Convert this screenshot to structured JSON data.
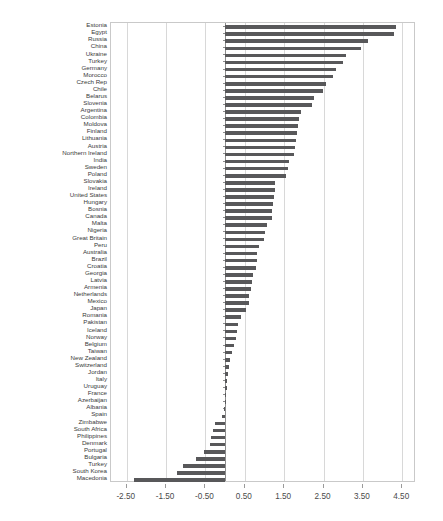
{
  "chart_data": {
    "type": "bar",
    "orientation": "horizontal",
    "title": "",
    "subtitle": "",
    "xlabel": "",
    "ylabel": "",
    "xlim": [
      -2.9,
      4.85
    ],
    "grid": true,
    "legend": null,
    "bar_color": "#58585a",
    "xticks": [
      -2.5,
      -1.5,
      -0.5,
      0.5,
      1.5,
      2.5,
      3.5,
      4.5
    ],
    "xticklabels": [
      "-2.50",
      "-1.50",
      "-0.50",
      "0.50",
      "1.50",
      "2.50",
      "3.50",
      "4.50"
    ],
    "categories": [
      "Estonia",
      "Egypt",
      "Russia",
      "China",
      "Ukraine",
      "Turkey",
      "Germany",
      "Morocco",
      "Czech Rep",
      "Chile",
      "Belarus",
      "Slovenia",
      "Argentina",
      "Colombia",
      "Moldova",
      "Finland",
      "Lithuania",
      "Austria",
      "Northern Ireland",
      "India",
      "Sweden",
      "Poland",
      "Slovakia",
      "Ireland",
      "United States",
      "Hungary",
      "Bosnia",
      "Canada",
      "Malta",
      "Nigeria",
      "Great Britain",
      "Peru",
      "Australia",
      "Brazil",
      "Croatia",
      "Georgia",
      "Latvia",
      "Armenia",
      "Netherlands",
      "Mexico",
      "Japan",
      "Romania",
      "Pakistan",
      "Iceland",
      "Norway",
      "Belgium",
      "Taiwan",
      "New Zealand",
      "Switzerland",
      "Jordan",
      "Italy",
      "Uruguay",
      "France",
      "Azerbaijan",
      "Albania",
      "Spain",
      "Zimbabwe",
      "South Africa",
      "Philippines",
      "Denmark",
      "Portugal",
      "Bulgaria",
      "Turkey",
      "South Korea",
      "Macedonia"
    ],
    "values": [
      4.33,
      4.28,
      3.62,
      3.45,
      3.06,
      2.99,
      2.83,
      2.73,
      2.56,
      2.48,
      2.25,
      2.22,
      1.92,
      1.87,
      1.86,
      1.83,
      1.81,
      1.78,
      1.75,
      1.62,
      1.59,
      1.54,
      1.28,
      1.26,
      1.25,
      1.22,
      1.2,
      1.18,
      1.06,
      1.02,
      1.0,
      0.86,
      0.81,
      0.8,
      0.79,
      0.72,
      0.68,
      0.66,
      0.61,
      0.6,
      0.52,
      0.4,
      0.32,
      0.29,
      0.27,
      0.22,
      0.18,
      0.13,
      0.1,
      0.08,
      0.06,
      0.04,
      0.03,
      0.01,
      -0.02,
      -0.09,
      -0.25,
      -0.31,
      -0.36,
      -0.39,
      -0.53,
      -0.73,
      -1.07,
      -1.22,
      -2.32
    ]
  }
}
